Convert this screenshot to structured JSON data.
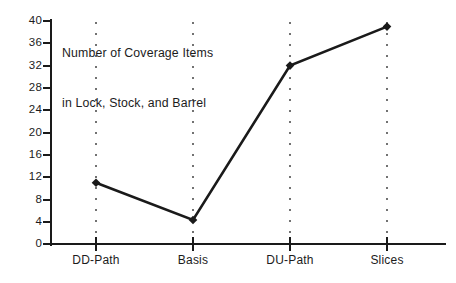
{
  "chart_data": {
    "type": "line",
    "title": "Number of Coverage Items in Lock, Stock, and Barrel",
    "title_lines": [
      "Number of Coverage Items",
      "in Lock, Stock, and Barrel"
    ],
    "xlabel": "",
    "ylabel": "",
    "categories": [
      "DD-Path",
      "Basis",
      "DU-Path",
      "Slices"
    ],
    "values": [
      11,
      4.3,
      32,
      39
    ],
    "series": [
      {
        "name": "Number of Coverage Items",
        "values": [
          11,
          4.3,
          32,
          39
        ]
      }
    ],
    "ylim": [
      0,
      40
    ],
    "ytick_labels": [
      "0",
      "4",
      "8",
      "12",
      "16",
      "20",
      "24",
      "28",
      "32",
      "36",
      "40"
    ],
    "ytick_values": [
      0,
      4,
      8,
      12,
      16,
      20,
      24,
      28,
      32,
      36,
      40
    ],
    "grid": "dotted-vertical-at-categories",
    "legend": "none",
    "marker": "filled-diamond",
    "line_color": "#1a1a1a",
    "text_color": "#1c1c1c",
    "background_color": "#ffffff"
  }
}
